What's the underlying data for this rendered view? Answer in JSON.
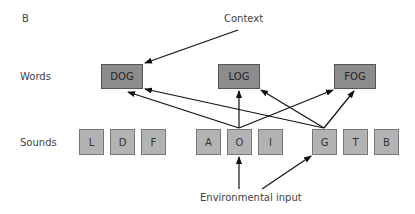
{
  "panel_label": "B",
  "row_labels": {
    "words": "Words",
    "sounds": "Sounds"
  },
  "annotations": {
    "context": "Context",
    "environmental_input": "Environmental input"
  },
  "words": [
    {
      "id": "dog",
      "label": "DOG"
    },
    {
      "id": "log",
      "label": "LOG"
    },
    {
      "id": "fog",
      "label": "FOG"
    }
  ],
  "sounds": [
    {
      "id": "l",
      "label": "L"
    },
    {
      "id": "d",
      "label": "D"
    },
    {
      "id": "f",
      "label": "F"
    },
    {
      "id": "a",
      "label": "A"
    },
    {
      "id": "o",
      "label": "O"
    },
    {
      "id": "i",
      "label": "I"
    },
    {
      "id": "g",
      "label": "G"
    },
    {
      "id": "t",
      "label": "T"
    },
    {
      "id": "b",
      "label": "B"
    }
  ],
  "connections": [
    {
      "from": "Context",
      "to": "DOG"
    },
    {
      "from": "O",
      "to": "DOG"
    },
    {
      "from": "O",
      "to": "LOG"
    },
    {
      "from": "O",
      "to": "FOG"
    },
    {
      "from": "G",
      "to": "DOG"
    },
    {
      "from": "G",
      "to": "LOG"
    },
    {
      "from": "G",
      "to": "FOG"
    },
    {
      "from": "Environmental input",
      "to": "O"
    },
    {
      "from": "Environmental input",
      "to": "G"
    }
  ],
  "colors": {
    "word_box": "#8c8c8c",
    "sound_box": "#b3b3b3",
    "arrow": "#111111"
  }
}
